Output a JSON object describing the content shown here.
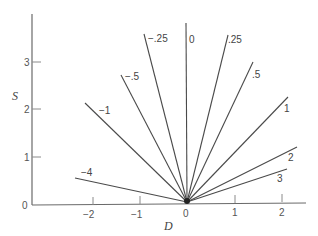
{
  "diagram": {
    "type": "ray-fan",
    "x_axis": {
      "label": "D",
      "ticks": [
        "−2",
        "−1",
        "0",
        "1",
        "2"
      ]
    },
    "y_axis": {
      "label": "S",
      "ticks": [
        "0",
        "1",
        "2",
        "3"
      ]
    },
    "rays": [
      {
        "label": "−4",
        "slope": -4
      },
      {
        "label": "−1",
        "slope": -1
      },
      {
        "label": "−.5",
        "slope": -0.5
      },
      {
        "label": "−.25",
        "slope": -0.25
      },
      {
        "label": "0",
        "slope": 0
      },
      {
        "label": ".25",
        "slope": 0.25
      },
      {
        "label": ".5",
        "slope": 0.5
      },
      {
        "label": "1",
        "slope": 1
      },
      {
        "label": "2",
        "slope": 2
      },
      {
        "label": "3",
        "slope": 3
      }
    ],
    "origin_marker": "filled-dot"
  }
}
